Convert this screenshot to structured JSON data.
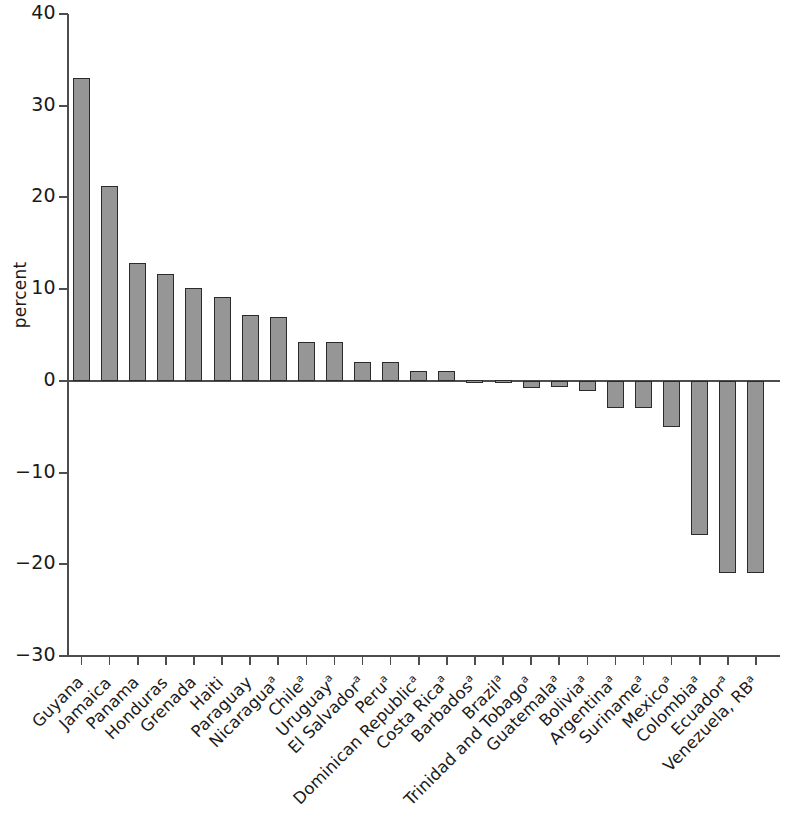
{
  "chart_data": {
    "type": "bar",
    "title": "",
    "xlabel": "",
    "ylabel": "percent",
    "ylim": [
      -30,
      40
    ],
    "yticks": [
      40,
      30,
      20,
      10,
      0,
      -10,
      -20,
      -30
    ],
    "ytick_labels": [
      "40",
      "30",
      "20",
      "10",
      "0",
      "−10",
      "−20",
      "−30"
    ],
    "grid": false,
    "legend": null,
    "bar_color": "#969696",
    "bar_edge_color": "#2b2b2b",
    "axis_color": "#4d4d4d",
    "footnote_marker": "a",
    "categories": [
      "Guyana",
      "Jamaica",
      "Panama",
      "Honduras",
      "Grenada",
      "Haiti",
      "Paraguay",
      "Nicaragua",
      "Chile",
      "Uruguay",
      "El Salvador",
      "Peru",
      "Dominican Republic",
      "Costa Rica",
      "Barbados",
      "Brazil",
      "Trinidad and Tobago",
      "Guatemala",
      "Bolivia",
      "Argentina",
      "Suriname",
      "Mexico",
      "Colombia",
      "Ecuador",
      "Venezuela, RB"
    ],
    "category_has_footnote": [
      false,
      false,
      false,
      false,
      false,
      false,
      false,
      true,
      true,
      true,
      true,
      true,
      true,
      true,
      true,
      true,
      true,
      true,
      true,
      true,
      true,
      true,
      true,
      true,
      true
    ],
    "values": [
      33.0,
      21.2,
      12.8,
      11.7,
      10.1,
      9.1,
      7.2,
      7.0,
      4.2,
      4.2,
      2.1,
      2.1,
      1.1,
      1.1,
      0.1,
      0.1,
      -0.8,
      -0.7,
      -1.1,
      -3.0,
      -3.0,
      -5.0,
      -16.8,
      -21.0,
      -21.0
    ]
  }
}
